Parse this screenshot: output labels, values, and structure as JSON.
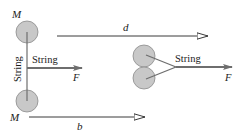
{
  "left_system": {
    "top_mass_label": "M",
    "bottom_mass_label": "M",
    "vertical_string_label": "String",
    "horizontal_string_label": "String",
    "force_label": "F"
  },
  "right_system": {
    "string_label": "String",
    "force_label": "F"
  },
  "displacements": {
    "d_label": "d",
    "b_label": "b"
  },
  "colors": {
    "disk_fill": "#c8c8c8",
    "disk_stroke": "#8a8a8a",
    "line": "#3a3a3a",
    "force_arrow": "#6e6e6e"
  }
}
